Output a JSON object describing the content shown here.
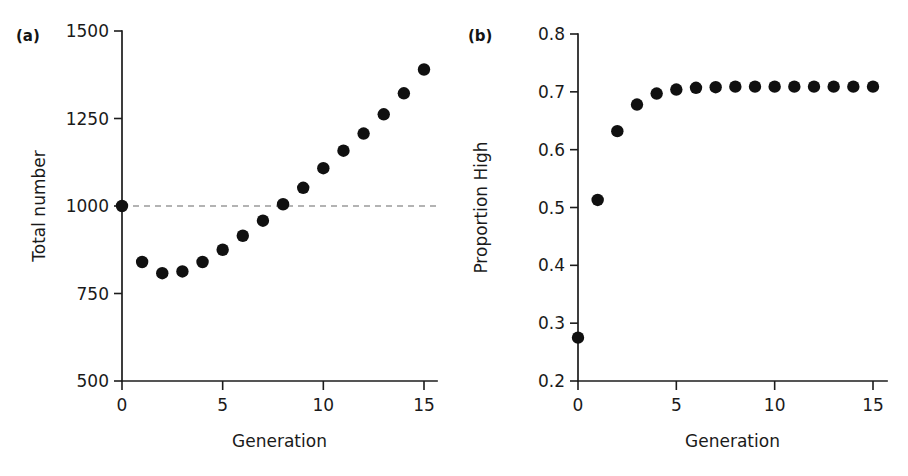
{
  "figure": {
    "background": "#ffffff",
    "marker_color": "#101010",
    "axis_color": "#1c1c1c",
    "refline_color": "#9a9a9a"
  },
  "panels": [
    {
      "letter": "(a)",
      "chart_data": {
        "type": "scatter",
        "title": "",
        "xlabel": "Generation",
        "ylabel": "Total number",
        "x": [
          0,
          1,
          2,
          3,
          4,
          5,
          6,
          7,
          8,
          9,
          10,
          11,
          12,
          13,
          14,
          15
        ],
        "values": [
          1000,
          840,
          808,
          813,
          840,
          875,
          915,
          958,
          1005,
          1052,
          1108,
          1158,
          1207,
          1262,
          1322,
          1390
        ],
        "xlim": [
          0,
          15
        ],
        "ylim": [
          500,
          1500
        ],
        "xticks": [
          0,
          5,
          10,
          15
        ],
        "xticklabels": [
          "0",
          "5",
          "10",
          "15"
        ],
        "yticks": [
          500,
          750,
          1000,
          1250,
          1500
        ],
        "yticklabels": [
          "500",
          "750",
          "1000",
          "1250",
          "1500"
        ],
        "grid": false,
        "legend": "none",
        "annotations": [
          {
            "type": "horizontal-reference-line",
            "value": 1000,
            "style": "dashed",
            "label": ""
          }
        ]
      }
    },
    {
      "letter": "(b)",
      "chart_data": {
        "type": "scatter",
        "title": "",
        "xlabel": "Generation",
        "ylabel": "Proportion High",
        "x": [
          0,
          1,
          2,
          3,
          4,
          5,
          6,
          7,
          8,
          9,
          10,
          11,
          12,
          13,
          14,
          15
        ],
        "values": [
          0.275,
          0.513,
          0.632,
          0.678,
          0.697,
          0.704,
          0.707,
          0.708,
          0.709,
          0.709,
          0.709,
          0.709,
          0.709,
          0.709,
          0.709,
          0.709
        ],
        "xlim": [
          0,
          15
        ],
        "ylim": [
          0.2,
          0.8
        ],
        "xticks": [
          0,
          5,
          10,
          15
        ],
        "xticklabels": [
          "0",
          "5",
          "10",
          "15"
        ],
        "yticks": [
          0.2,
          0.3,
          0.4,
          0.5,
          0.6,
          0.7,
          0.8
        ],
        "yticklabels": [
          "0.2",
          "0.3",
          "0.4",
          "0.5",
          "0.6",
          "0.7",
          "0.8"
        ],
        "grid": false,
        "legend": "none",
        "annotations": []
      }
    }
  ]
}
